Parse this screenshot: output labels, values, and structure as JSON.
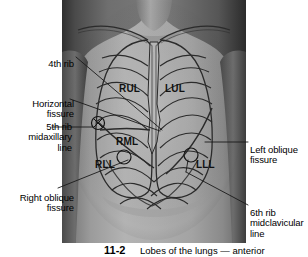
{
  "figure": {
    "title": "Lobes of the lungs — anterior",
    "photo": {
      "kind": "grayscale-photograph",
      "subject": "human-anterior-thorax",
      "overlay": "lung-lobes-and-ribcage-outline"
    },
    "caption": {
      "number": "11-2",
      "text": "Lobes of the lungs — anterior"
    }
  },
  "lobe_labels": [
    {
      "id": "rul",
      "text": "RUL",
      "meaning": "right upper lobe"
    },
    {
      "id": "lul",
      "text": "LUL",
      "meaning": "left upper lobe"
    },
    {
      "id": "rml",
      "text": "RML",
      "meaning": "right middle lobe"
    },
    {
      "id": "rll",
      "text": "RLL",
      "meaning": "right lower lobe"
    },
    {
      "id": "lll",
      "text": "LLL",
      "meaning": "left lower lobe"
    }
  ],
  "annotations": [
    {
      "id": "fourth-rib",
      "text": "4th rib",
      "side": "left"
    },
    {
      "id": "horizontal-fissure",
      "text": "Horizontal\nfissure",
      "side": "left"
    },
    {
      "id": "fifth-rib-midaxillary",
      "text": "5th rib\nmidaxillary\nline",
      "side": "left"
    },
    {
      "id": "right-oblique-fissure",
      "text": "Right oblique\nfissure",
      "side": "left"
    },
    {
      "id": "left-oblique-fissure",
      "text": "Left oblique\nfissure",
      "side": "right"
    },
    {
      "id": "sixth-rib-midclavicular",
      "text": "6th rib\nmidclavicular\nline",
      "side": "right"
    }
  ],
  "markers": [
    {
      "id": "marker-5th-rib-midaxillary",
      "glyph": "circle-with-x"
    },
    {
      "id": "marker-rll",
      "glyph": "open-circle"
    },
    {
      "id": "marker-lll",
      "glyph": "open-circle"
    }
  ],
  "colors": {
    "background": "#ffffff",
    "text": "#000000",
    "leader_line": "#1a1a1a",
    "overlay_line": "#2b2b2b",
    "photo_mid_gray": "#8e8e8e",
    "photo_dark_gray": "#3a3a3a",
    "photo_light_gray": "#b9b9b9"
  }
}
